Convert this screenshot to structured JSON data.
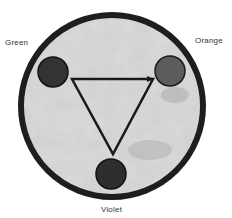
{
  "diagram": {
    "type": "color-wheel-triangle",
    "outer_circle": {
      "cx": 112,
      "cy": 106,
      "r": 92,
      "stroke": "#1e1e1e",
      "stroke_width": 6,
      "fill": "#c8c8c8"
    },
    "nodes": [
      {
        "id": "green",
        "label": "Green",
        "cx": 53,
        "cy": 72,
        "r": 15,
        "fill": "#333333"
      },
      {
        "id": "orange",
        "label": "Orange",
        "cx": 170,
        "cy": 71,
        "r": 15,
        "fill": "#5c5c5c"
      },
      {
        "id": "violet",
        "label": "Violet",
        "cx": 111,
        "cy": 174,
        "r": 15,
        "fill": "#2e2e2e"
      }
    ],
    "triangle": {
      "points": "72,79 153,79 113,154",
      "stroke": "#1a1a1a",
      "stroke_width": 2.5
    },
    "labels": {
      "green": "Green",
      "orange": "Orange",
      "violet": "Violet"
    }
  }
}
